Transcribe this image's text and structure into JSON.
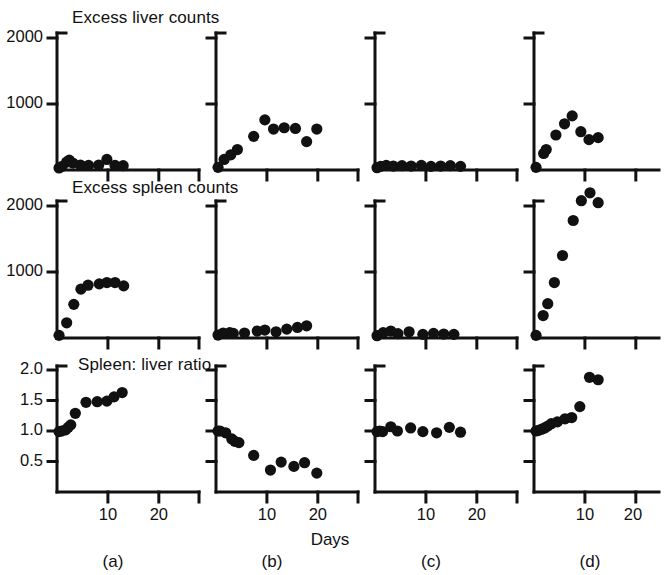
{
  "figure": {
    "width": 660,
    "height": 575,
    "background": "#ffffff",
    "ink_color": "#111111",
    "marker_color": "#111111",
    "x_axis_title": "Days",
    "row_titles": [
      "Excess liver counts",
      "Excess spleen counts",
      "Spleen: liver ratio"
    ],
    "column_labels": [
      "(a)",
      "(b)",
      "(c)",
      "(d)"
    ]
  },
  "axes": {
    "rows_1_2": {
      "y_ticks": [
        1000,
        2000
      ],
      "y_tick_labels": [
        "1000",
        "2000"
      ],
      "ylim": [
        0,
        2000
      ]
    },
    "row_3": {
      "y_ticks": [
        0.5,
        1.0,
        1.5,
        2.0
      ],
      "y_tick_labels": [
        "0.5",
        "1.0",
        "1.5",
        "2.0"
      ],
      "ylim": [
        0,
        2.0
      ]
    },
    "x_ticks": [
      10,
      20
    ],
    "x_tick_labels": [
      "10",
      "20"
    ],
    "xlim": [
      0,
      22
    ]
  },
  "chart_data": [
    {
      "type": "scatter",
      "panel": "(a)",
      "row": 1,
      "title": "Excess liver counts",
      "xlabel": "Days",
      "ylabel": "Excess liver counts",
      "xlim": [
        0,
        22
      ],
      "ylim": [
        0,
        2000
      ],
      "grid": false,
      "legend": "none",
      "x": [
        0.4,
        1.0,
        1.9,
        2.4,
        3.1,
        4.6,
        6.2,
        8.2,
        9.8,
        11.4,
        13.0
      ],
      "y": [
        30,
        55,
        120,
        150,
        105,
        75,
        70,
        75,
        160,
        70,
        65
      ]
    },
    {
      "type": "scatter",
      "panel": "(b)",
      "row": 1,
      "title": "Excess liver counts",
      "xlabel": "Days",
      "ylabel": "Excess liver counts",
      "xlim": [
        0,
        22
      ],
      "ylim": [
        0,
        2000
      ],
      "grid": false,
      "legend": "none",
      "x": [
        0.4,
        1.6,
        2.9,
        4.2,
        7.4,
        9.6,
        11.3,
        13.4,
        15.6,
        17.8,
        19.8
      ],
      "y": [
        40,
        160,
        230,
        310,
        510,
        760,
        620,
        640,
        630,
        430,
        620
      ]
    },
    {
      "type": "scatter",
      "panel": "(c)",
      "row": 1,
      "title": "Excess liver counts",
      "xlabel": "Days",
      "ylabel": "Excess liver counts",
      "xlim": [
        0,
        22
      ],
      "ylim": [
        0,
        2000
      ],
      "grid": false,
      "legend": "none",
      "x": [
        0.4,
        1.1,
        2.2,
        3.6,
        5.3,
        7.1,
        9.1,
        11.0,
        12.9,
        14.8,
        16.8
      ],
      "y": [
        35,
        55,
        70,
        60,
        65,
        60,
        70,
        55,
        60,
        65,
        55
      ]
    },
    {
      "type": "scatter",
      "panel": "(d)",
      "row": 1,
      "title": "Excess liver counts",
      "xlabel": "Days",
      "ylabel": "Excess liver counts",
      "xlim": [
        0,
        22
      ],
      "ylim": [
        0,
        2000
      ],
      "grid": false,
      "legend": "none",
      "x": [
        0.4,
        1.9,
        2.4,
        4.3,
        6.0,
        7.5,
        9.2,
        10.8,
        12.6
      ],
      "y": [
        40,
        250,
        310,
        530,
        700,
        820,
        580,
        460,
        490
      ]
    },
    {
      "type": "scatter",
      "panel": "(a)",
      "row": 2,
      "title": "Excess spleen counts",
      "xlabel": "Days",
      "ylabel": "Excess spleen counts",
      "xlim": [
        0,
        22
      ],
      "ylim": [
        0,
        2000
      ],
      "grid": false,
      "legend": "none",
      "x": [
        0.4,
        1.9,
        3.3,
        4.7,
        6.1,
        8.3,
        9.8,
        11.4,
        13.1
      ],
      "y": [
        40,
        230,
        510,
        740,
        800,
        820,
        840,
        840,
        790
      ]
    },
    {
      "type": "scatter",
      "panel": "(b)",
      "row": 2,
      "title": "Excess spleen counts",
      "xlabel": "Days",
      "ylabel": "Excess spleen counts",
      "xlim": [
        0,
        22
      ],
      "ylim": [
        0,
        2000
      ],
      "grid": false,
      "legend": "none",
      "x": [
        0.4,
        1.4,
        2.7,
        3.4,
        5.6,
        8.1,
        9.6,
        11.8,
        13.9,
        16.0,
        17.8
      ],
      "y": [
        45,
        75,
        80,
        70,
        75,
        105,
        120,
        95,
        135,
        160,
        185
      ]
    },
    {
      "type": "scatter",
      "panel": "(c)",
      "row": 2,
      "title": "Excess spleen counts",
      "xlabel": "Days",
      "ylabel": "Excess spleen counts",
      "xlim": [
        0,
        22
      ],
      "ylim": [
        0,
        2000
      ],
      "grid": false,
      "legend": "none",
      "x": [
        0.4,
        1.6,
        3.1,
        4.5,
        6.7,
        9.4,
        11.5,
        13.5,
        15.5
      ],
      "y": [
        35,
        80,
        105,
        65,
        95,
        55,
        70,
        60,
        55
      ]
    },
    {
      "type": "scatter",
      "panel": "(d)",
      "row": 2,
      "title": "Excess spleen counts",
      "xlabel": "Days",
      "ylabel": "Excess spleen counts",
      "xlim": [
        0,
        22
      ],
      "ylim": [
        0,
        2000
      ],
      "grid": false,
      "legend": "none",
      "x": [
        0.4,
        1.8,
        2.7,
        4.0,
        5.6,
        7.7,
        9.3,
        11.0,
        12.6
      ],
      "y": [
        40,
        340,
        520,
        840,
        1250,
        1780,
        2080,
        2200,
        2050
      ]
    },
    {
      "type": "scatter",
      "panel": "(a)",
      "row": 3,
      "title": "Spleen: liver ratio",
      "xlabel": "Days",
      "ylabel": "Spleen: liver ratio",
      "xlim": [
        0,
        22
      ],
      "ylim": [
        0,
        2.0
      ],
      "grid": false,
      "legend": "none",
      "x": [
        0.4,
        0.9,
        1.7,
        2.2,
        2.7,
        3.6,
        5.7,
        7.9,
        9.8,
        11.2,
        12.8
      ],
      "y": [
        0.99,
        1.0,
        1.02,
        1.06,
        1.1,
        1.29,
        1.47,
        1.48,
        1.49,
        1.56,
        1.63
      ]
    },
    {
      "type": "scatter",
      "panel": "(b)",
      "row": 3,
      "title": "Spleen: liver ratio",
      "xlabel": "Days",
      "ylabel": "Spleen: liver ratio",
      "xlim": [
        0,
        22
      ],
      "ylim": [
        0,
        2.0
      ],
      "grid": false,
      "legend": "none",
      "x": [
        0.4,
        0.8,
        1.9,
        3.1,
        3.7,
        4.5,
        7.4,
        10.7,
        12.8,
        15.3,
        17.4,
        19.8
      ],
      "y": [
        1.0,
        1.0,
        0.97,
        0.87,
        0.83,
        0.81,
        0.6,
        0.36,
        0.49,
        0.42,
        0.48,
        0.31
      ]
    },
    {
      "type": "scatter",
      "panel": "(c)",
      "row": 3,
      "title": "Spleen: liver ratio",
      "xlabel": "Days",
      "ylabel": "Spleen: liver ratio",
      "xlim": [
        0,
        22
      ],
      "ylim": [
        0,
        2.0
      ],
      "grid": false,
      "legend": "none",
      "x": [
        0.4,
        0.9,
        1.5,
        3.1,
        4.4,
        7.0,
        9.4,
        12.1,
        14.6,
        16.8
      ],
      "y": [
        0.99,
        1.0,
        0.99,
        1.07,
        1.0,
        1.05,
        0.99,
        0.97,
        1.06,
        0.98
      ]
    },
    {
      "type": "scatter",
      "panel": "(d)",
      "row": 3,
      "title": "Spleen: liver ratio",
      "xlabel": "Days",
      "ylabel": "Spleen: liver ratio",
      "xlim": [
        0,
        22
      ],
      "ylim": [
        0,
        2.0
      ],
      "grid": false,
      "legend": "none",
      "x": [
        0.4,
        0.9,
        1.5,
        2.1,
        2.7,
        3.4,
        4.6,
        6.1,
        7.4,
        9.0,
        10.9,
        12.6
      ],
      "y": [
        1.0,
        1.01,
        1.03,
        1.05,
        1.08,
        1.12,
        1.15,
        1.2,
        1.22,
        1.4,
        1.88,
        1.84
      ]
    }
  ]
}
